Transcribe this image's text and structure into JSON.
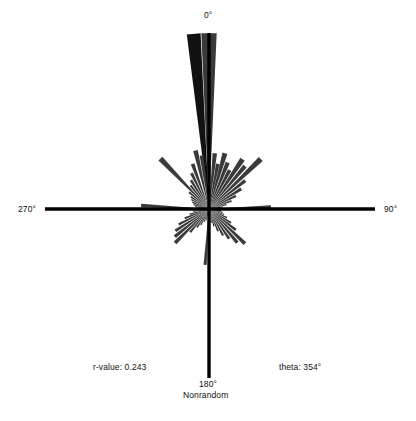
{
  "figure": {
    "type": "rose-diagram",
    "background": "#ffffff",
    "axis_color": "#000000",
    "petal_color": "#3a3a3a",
    "petal_dark_color": "#111111"
  },
  "axis_labels": {
    "top": "0°",
    "right": "90°",
    "left": "270°",
    "bottom": "180°"
  },
  "annotations": {
    "randomness": "Nonrandom",
    "r_value": "r-value: 0.243",
    "theta": "theta: 354°"
  },
  "chart_data": {
    "type": "bar",
    "subtype": "polar-rose-histogram",
    "title": "",
    "xlabel": "",
    "ylabel": "",
    "grid": false,
    "legend": null,
    "center_px": [
      209,
      209
    ],
    "axis_extent_px": {
      "left": 45,
      "right": 375,
      "top": 33,
      "bottom": 378
    },
    "angle_convention": "compass: 0° up, increases clockwise",
    "max_radius_px": 176,
    "summary_statistics": {
      "r_value": 0.243,
      "mean_theta_deg": 354,
      "distribution": "Nonrandom"
    },
    "axis_tick_labels": [
      "0°",
      "90°",
      "180°",
      "270°"
    ],
    "categories": [
      "354°",
      "0°",
      "348°",
      "6°",
      "342°",
      "12°",
      "336°",
      "18°",
      "330°",
      "24°",
      "324°",
      "30°",
      "318°",
      "36°",
      "312°",
      "42°",
      "306°",
      "48°",
      "300°",
      "54°",
      "294°",
      "60°",
      "288°",
      "66°",
      "282°",
      "72°",
      "276°",
      "78°",
      "270°",
      "84°",
      "264°",
      "90°",
      "258°",
      "96°",
      "252°",
      "102°",
      "246°",
      "108°",
      "240°",
      "114°",
      "234°",
      "120°",
      "228°",
      "126°",
      "222°",
      "132°",
      "216°",
      "138°",
      "210°",
      "144°",
      "204°",
      "150°",
      "198°",
      "156°",
      "192°",
      "162°",
      "186°",
      "168°",
      "180°",
      "174°"
    ],
    "petals": [
      {
        "angle_deg": 355,
        "radius_px": 176,
        "width_deg": 4.5,
        "shade": "dark"
      },
      {
        "angle_deg": 0,
        "radius_px": 176,
        "width_deg": 5.0,
        "shade": "mid"
      },
      {
        "angle_deg": 347,
        "radius_px": 60,
        "width_deg": 4.5,
        "shade": "mid"
      },
      {
        "angle_deg": 352,
        "radius_px": 54,
        "width_deg": 4.0,
        "shade": "mid"
      },
      {
        "angle_deg": 340,
        "radius_px": 48,
        "width_deg": 4.5,
        "shade": "mid"
      },
      {
        "angle_deg": 334,
        "radius_px": 40,
        "width_deg": 4.5,
        "shade": "mid"
      },
      {
        "angle_deg": 328,
        "radius_px": 34,
        "width_deg": 4.5,
        "shade": "mid"
      },
      {
        "angle_deg": 322,
        "radius_px": 30,
        "width_deg": 4.5,
        "shade": "mid"
      },
      {
        "angle_deg": 316,
        "radius_px": 70,
        "width_deg": 4.5,
        "shade": "mid"
      },
      {
        "angle_deg": 310,
        "radius_px": 26,
        "width_deg": 4.5,
        "shade": "mid"
      },
      {
        "angle_deg": 304,
        "radius_px": 22,
        "width_deg": 4.5,
        "shade": "mid"
      },
      {
        "angle_deg": 298,
        "radius_px": 20,
        "width_deg": 4.5,
        "shade": "mid"
      },
      {
        "angle_deg": 292,
        "radius_px": 18,
        "width_deg": 4.5,
        "shade": "mid"
      },
      {
        "angle_deg": 286,
        "radius_px": 16,
        "width_deg": 4.5,
        "shade": "mid"
      },
      {
        "angle_deg": 280,
        "radius_px": 14,
        "width_deg": 4.5,
        "shade": "mid"
      },
      {
        "angle_deg": 273,
        "radius_px": 68,
        "width_deg": 3.0,
        "shade": "mid"
      },
      {
        "angle_deg": 267,
        "radius_px": 12,
        "width_deg": 4.5,
        "shade": "mid"
      },
      {
        "angle_deg": 261,
        "radius_px": 16,
        "width_deg": 4.5,
        "shade": "mid"
      },
      {
        "angle_deg": 255,
        "radius_px": 20,
        "width_deg": 4.5,
        "shade": "mid"
      },
      {
        "angle_deg": 249,
        "radius_px": 26,
        "width_deg": 4.5,
        "shade": "mid"
      },
      {
        "angle_deg": 243,
        "radius_px": 34,
        "width_deg": 4.5,
        "shade": "mid"
      },
      {
        "angle_deg": 237,
        "radius_px": 40,
        "width_deg": 4.5,
        "shade": "mid"
      },
      {
        "angle_deg": 231,
        "radius_px": 44,
        "width_deg": 4.5,
        "shade": "mid"
      },
      {
        "angle_deg": 225,
        "radius_px": 48,
        "width_deg": 4.5,
        "shade": "mid"
      },
      {
        "angle_deg": 219,
        "radius_px": 30,
        "width_deg": 4.5,
        "shade": "mid"
      },
      {
        "angle_deg": 213,
        "radius_px": 22,
        "width_deg": 4.5,
        "shade": "mid"
      },
      {
        "angle_deg": 207,
        "radius_px": 18,
        "width_deg": 4.5,
        "shade": "mid"
      },
      {
        "angle_deg": 201,
        "radius_px": 14,
        "width_deg": 4.5,
        "shade": "mid"
      },
      {
        "angle_deg": 195,
        "radius_px": 12,
        "width_deg": 4.5,
        "shade": "mid"
      },
      {
        "angle_deg": 184,
        "radius_px": 56,
        "width_deg": 3.2,
        "shade": "mid"
      },
      {
        "angle_deg": 176,
        "radius_px": 12,
        "width_deg": 4.5,
        "shade": "mid"
      },
      {
        "angle_deg": 170,
        "radius_px": 14,
        "width_deg": 4.5,
        "shade": "mid"
      },
      {
        "angle_deg": 164,
        "radius_px": 18,
        "width_deg": 4.5,
        "shade": "mid"
      },
      {
        "angle_deg": 158,
        "radius_px": 24,
        "width_deg": 4.5,
        "shade": "mid"
      },
      {
        "angle_deg": 152,
        "radius_px": 30,
        "width_deg": 4.5,
        "shade": "mid"
      },
      {
        "angle_deg": 146,
        "radius_px": 36,
        "width_deg": 4.5,
        "shade": "mid"
      },
      {
        "angle_deg": 140,
        "radius_px": 44,
        "width_deg": 4.5,
        "shade": "mid"
      },
      {
        "angle_deg": 134,
        "radius_px": 50,
        "width_deg": 4.5,
        "shade": "mid"
      },
      {
        "angle_deg": 128,
        "radius_px": 34,
        "width_deg": 4.5,
        "shade": "mid"
      },
      {
        "angle_deg": 122,
        "radius_px": 26,
        "width_deg": 4.5,
        "shade": "mid"
      },
      {
        "angle_deg": 116,
        "radius_px": 20,
        "width_deg": 4.5,
        "shade": "mid"
      },
      {
        "angle_deg": 110,
        "radius_px": 16,
        "width_deg": 4.5,
        "shade": "mid"
      },
      {
        "angle_deg": 104,
        "radius_px": 14,
        "width_deg": 4.5,
        "shade": "mid"
      },
      {
        "angle_deg": 98,
        "radius_px": 12,
        "width_deg": 4.5,
        "shade": "mid"
      },
      {
        "angle_deg": 88,
        "radius_px": 62,
        "width_deg": 3.0,
        "shade": "mid"
      },
      {
        "angle_deg": 82,
        "radius_px": 14,
        "width_deg": 4.5,
        "shade": "mid"
      },
      {
        "angle_deg": 76,
        "radius_px": 18,
        "width_deg": 4.5,
        "shade": "mid"
      },
      {
        "angle_deg": 70,
        "radius_px": 24,
        "width_deg": 4.5,
        "shade": "mid"
      },
      {
        "angle_deg": 64,
        "radius_px": 30,
        "width_deg": 4.5,
        "shade": "mid"
      },
      {
        "angle_deg": 58,
        "radius_px": 38,
        "width_deg": 4.5,
        "shade": "mid"
      },
      {
        "angle_deg": 52,
        "radius_px": 46,
        "width_deg": 4.5,
        "shade": "mid"
      },
      {
        "angle_deg": 46,
        "radius_px": 72,
        "width_deg": 4.5,
        "shade": "mid"
      },
      {
        "angle_deg": 40,
        "radius_px": 56,
        "width_deg": 4.5,
        "shade": "mid"
      },
      {
        "angle_deg": 34,
        "radius_px": 60,
        "width_deg": 5.0,
        "shade": "mid"
      },
      {
        "angle_deg": 28,
        "radius_px": 44,
        "width_deg": 5.0,
        "shade": "mid"
      },
      {
        "angle_deg": 22,
        "radius_px": 50,
        "width_deg": 5.0,
        "shade": "mid"
      },
      {
        "angle_deg": 16,
        "radius_px": 58,
        "width_deg": 5.0,
        "shade": "mid"
      },
      {
        "angle_deg": 11,
        "radius_px": 46,
        "width_deg": 4.5,
        "shade": "mid"
      },
      {
        "angle_deg": 6,
        "radius_px": 56,
        "width_deg": 4.5,
        "shade": "mid"
      }
    ]
  }
}
